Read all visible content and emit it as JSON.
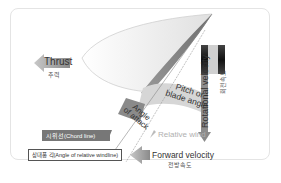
{
  "diagram": {
    "labels": {
      "thrust": "Thrust",
      "thrust_ko": "추력",
      "pitch": "Pitch or blade angle",
      "pitch_line1": "Pitch or",
      "pitch_line2": "blade angle",
      "angle_of_attack_line1": "Angle",
      "angle_of_attack_line2": "of attack",
      "relative_wind": "Relative wind",
      "rotational_velocity": "Rotational velocity",
      "rotational_velocity_ko": "회전속도",
      "chord_line": "시위선(Chord line)",
      "angle_relative_wind": "상대풍 각(Angle of relative windline)",
      "forward_velocity": "Forward velocity",
      "forward_velocity_ko": "전방속도"
    },
    "colors": {
      "arrow_gray": "#8a8a8a",
      "blade_dark": "#7a7a7a",
      "band_light": "#d8d8d8",
      "chord_bg": "#777777"
    }
  }
}
